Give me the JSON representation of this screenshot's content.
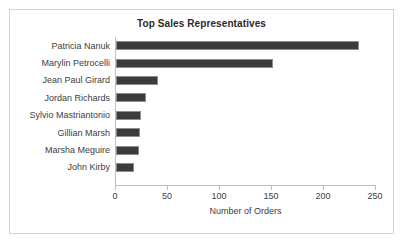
{
  "chart_data": {
    "type": "bar",
    "orientation": "horizontal",
    "title": "Top Sales Representatives",
    "xlabel": "Number of Orders",
    "ylabel": "",
    "categories": [
      "Patricia Nanuk",
      "Marylin Petrocelli",
      "Jean Paul Girard",
      "Jordan Richards",
      "Sylvio Mastriantonio",
      "Gillian Marsh",
      "Marsha Meguire",
      "John Kirby"
    ],
    "values": [
      234,
      151,
      40,
      29,
      24,
      23,
      22,
      17
    ],
    "xlim": [
      0,
      250
    ],
    "xticks": [
      0,
      50,
      100,
      150,
      200,
      250
    ],
    "xtick_labels": [
      "0",
      "50",
      "100",
      "150",
      "200",
      "250"
    ],
    "grid": false,
    "legend": false,
    "bar_color": "#3b3b3b",
    "bar_border_color": "#8e8e8e",
    "axis_color": "#c0c0c0",
    "frame_color": "#d2d2d2",
    "background_color": "#ffffff",
    "title_color": "#2b2b2b",
    "text_color": "#3d3d3d"
  }
}
